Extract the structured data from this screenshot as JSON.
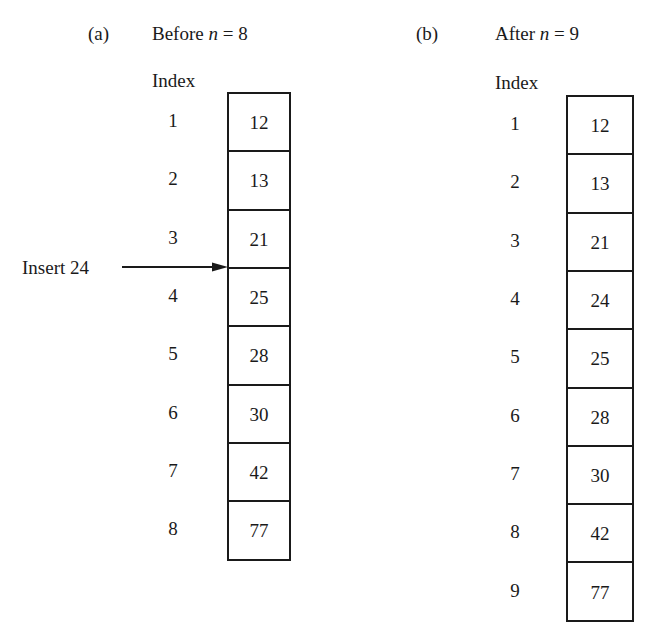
{
  "panel_a": {
    "tag": "(a)",
    "title_prefix": "Before ",
    "title_var": "n",
    "title_suffix": " = 8",
    "index_header": "Index",
    "indices": [
      "1",
      "2",
      "3",
      "4",
      "5",
      "6",
      "7",
      "8"
    ],
    "values": [
      "12",
      "13",
      "21",
      "25",
      "28",
      "30",
      "42",
      "77"
    ],
    "insert_label": "Insert 24"
  },
  "panel_b": {
    "tag": "(b)",
    "title_prefix": "After ",
    "title_var": "n",
    "title_suffix": " = 9",
    "index_header": "Index",
    "indices": [
      "1",
      "2",
      "3",
      "4",
      "5",
      "6",
      "7",
      "8",
      "9"
    ],
    "values": [
      "12",
      "13",
      "21",
      "24",
      "25",
      "28",
      "30",
      "42",
      "77"
    ]
  }
}
